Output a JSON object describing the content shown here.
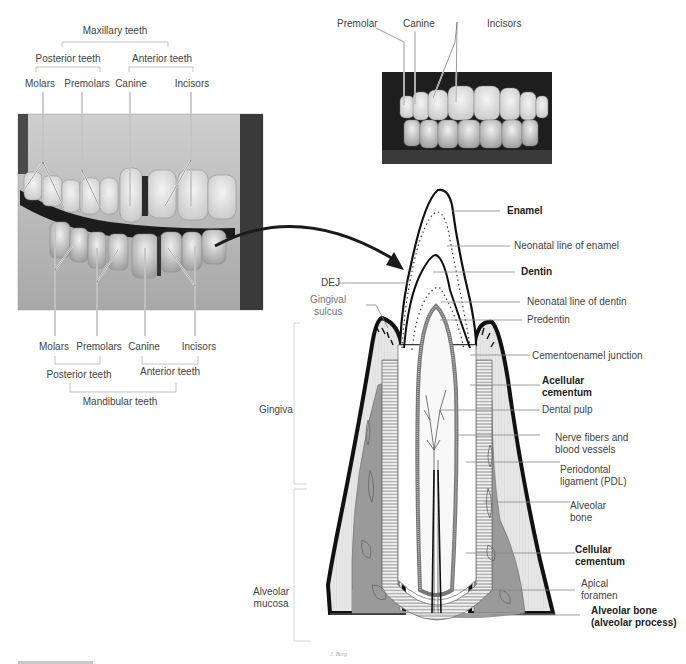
{
  "maxillary": {
    "group": "Maxillary teeth",
    "posterior": "Posterior teeth",
    "anterior": "Anterior teeth",
    "molars": "Molars",
    "premolars": "Premolars",
    "canine": "Canine",
    "incisors": "Incisors"
  },
  "mandibular": {
    "group": "Mandibular teeth",
    "posterior": "Posterior teeth",
    "anterior": "Anterior teeth",
    "molars": "Molars",
    "premolars": "Premolars",
    "canine": "Canine",
    "incisors": "Incisors"
  },
  "frontal_photo": {
    "premolar": "Premolar",
    "canine": "Canine",
    "incisors": "Incisors"
  },
  "section": {
    "enamel": "Enamel",
    "neonatal_enamel": "Neonatal line of enamel",
    "dentin": "Dentin",
    "neonatal_dentin": "Neonatal line of dentin",
    "predentin": "Predentin",
    "dej": "DEJ",
    "gingival_sulcus": "Gingival\nsulcus",
    "cej": "Cementoenamel junction",
    "acellular_cementum": "Acellular\ncementum",
    "dental_pulp": "Dental pulp",
    "nerve_fibers": "Nerve fibers and\nblood vessels",
    "pdl": "Periodontal\nligament (PDL)",
    "alveolar_bone": "Alveolar\nbone",
    "cellular_cementum": "Cellular\ncementum",
    "apical_foramen": "Apical\nforamen",
    "alveolar_process": "Alveolar bone\n(alveolar process)",
    "gingiva": "Gingiva",
    "alveolar_mucosa": "Alveolar\nmucosa",
    "signature": "J. Berg"
  },
  "colors": {
    "bone_gray": "#9a9a9a",
    "gingiva_light": "#e4e4e4",
    "outline": "#1a1a1a",
    "leader_line": "#888888"
  }
}
